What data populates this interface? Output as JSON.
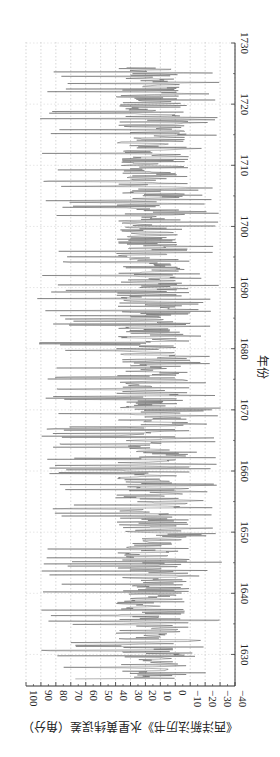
{
  "chart_data": {
    "type": "line",
    "orientation": "rotated-90-clockwise",
    "title": "",
    "xlabel": "年份",
    "ylabel": "《西洋新法历书》水星黄纬误差（角分）",
    "xlim": [
      1625,
      1730
    ],
    "ylim": [
      -40,
      100
    ],
    "x_ticks": [
      1630,
      1640,
      1650,
      1660,
      1670,
      1680,
      1690,
      1700,
      1710,
      1720,
      1730
    ],
    "y_ticks": [
      -40,
      -30,
      -20,
      -10,
      0,
      10,
      20,
      30,
      40,
      50,
      60,
      70,
      80,
      90,
      100
    ],
    "grid": "dotted vertical (value grid)",
    "legend": null,
    "series": [
      {
        "name": "水星黄纬误差",
        "color": "#333333",
        "x_start": 1626,
        "x_end": 1726,
        "typical_range": [
          -10,
          40
        ],
        "peak_max": 95,
        "peak_min": -35,
        "description": "dense high-frequency oscillation; core band roughly -10 to 40 arcmin, spikes up to ~95 and down to ~-35"
      }
    ],
    "sampled_peaks": [
      {
        "x": 1627,
        "max": 78,
        "min": -30
      },
      {
        "x": 1630,
        "max": 90,
        "min": -25
      },
      {
        "x": 1635,
        "max": 88,
        "min": -30
      },
      {
        "x": 1640,
        "max": 92,
        "min": -28
      },
      {
        "x": 1645,
        "max": 90,
        "min": -32
      },
      {
        "x": 1650,
        "max": 93,
        "min": -30
      },
      {
        "x": 1655,
        "max": 88,
        "min": -28
      },
      {
        "x": 1660,
        "max": 92,
        "min": -30
      },
      {
        "x": 1665,
        "max": 90,
        "min": -27
      },
      {
        "x": 1670,
        "max": 94,
        "min": -32
      },
      {
        "x": 1675,
        "max": 90,
        "min": -28
      },
      {
        "x": 1680,
        "max": 95,
        "min": -30
      },
      {
        "x": 1685,
        "max": 92,
        "min": -28
      },
      {
        "x": 1690,
        "max": 93,
        "min": -31
      },
      {
        "x": 1695,
        "max": 90,
        "min": -28
      },
      {
        "x": 1700,
        "max": 92,
        "min": -30
      },
      {
        "x": 1705,
        "max": 90,
        "min": -29
      },
      {
        "x": 1710,
        "max": 95,
        "min": -32
      },
      {
        "x": 1715,
        "max": 92,
        "min": -30
      },
      {
        "x": 1720,
        "max": 93,
        "min": -33
      },
      {
        "x": 1725,
        "max": 90,
        "min": -28
      }
    ]
  }
}
